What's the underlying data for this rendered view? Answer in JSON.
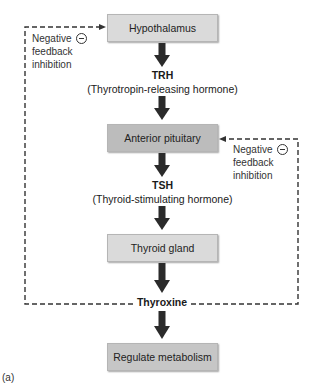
{
  "diagram": {
    "caption": "(a)",
    "nodes": [
      {
        "id": "hypothalamus",
        "label": "Hypothalamus"
      },
      {
        "id": "anterior_pituitary",
        "label": "Anterior pituitary"
      },
      {
        "id": "thyroid_gland",
        "label": "Thyroid gland"
      },
      {
        "id": "regulate_metabolism",
        "label": "Regulate metabolism"
      }
    ],
    "hormones": [
      {
        "abbr": "TRH",
        "full": "(Thyrotropin-releasing hormone)"
      },
      {
        "abbr": "TSH",
        "full": "(Thyroid-stimulating hormone)"
      },
      {
        "abbr": "Thyroxine",
        "full": ""
      }
    ],
    "feedback": [
      {
        "target": "hypothalamus",
        "line1": "Negative",
        "line2": "feedback",
        "line3": "inhibition",
        "symbol": "minus-circle"
      },
      {
        "target": "anterior_pituitary",
        "line1": "Negative",
        "line2": "feedback",
        "line3": "inhibition",
        "symbol": "minus-circle"
      }
    ],
    "edges": [
      {
        "from": "hypothalamus",
        "to": "anterior_pituitary",
        "via": "TRH",
        "type": "solid-arrow"
      },
      {
        "from": "anterior_pituitary",
        "to": "thyroid_gland",
        "via": "TSH",
        "type": "solid-arrow"
      },
      {
        "from": "thyroid_gland",
        "to": "regulate_metabolism",
        "via": "Thyroxine",
        "type": "solid-arrow"
      },
      {
        "from": "Thyroxine",
        "to": "hypothalamus",
        "type": "dashed-feedback"
      },
      {
        "from": "Thyroxine",
        "to": "anterior_pituitary",
        "type": "dashed-feedback"
      }
    ],
    "colors": {
      "box_light": "#dadada",
      "box_dark": "#bcbcbc",
      "box_mid": "#c6c6c6",
      "arrow": "#2b2b2b",
      "dashed_line": "#333333"
    }
  }
}
